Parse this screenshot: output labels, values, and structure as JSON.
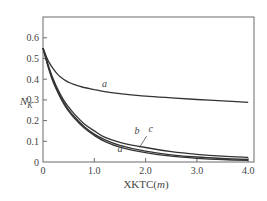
{
  "chart_data": {
    "type": "line",
    "title": "",
    "xlabel": "XKTC(m)",
    "xlabel_prefix": "XKTC(",
    "xlabel_unit": "m",
    "xlabel_suffix": ")",
    "ylabel": "N_K",
    "ylabel_main": "N",
    "ylabel_sub": "K",
    "xlim": [
      0,
      4.0
    ],
    "ylim": [
      0,
      0.7
    ],
    "x_ticks": [
      0,
      1.0,
      2.0,
      3.0,
      4.0
    ],
    "x_tick_labels": [
      "0",
      "1.0",
      "2.0",
      "3.0",
      "4.0"
    ],
    "y_ticks": [
      0,
      0.1,
      0.2,
      0.3,
      0.4,
      0.5,
      0.6
    ],
    "y_tick_labels": [
      "0",
      "0.1",
      "0.2",
      "0.3",
      "0.4",
      "0.5",
      "0.6"
    ],
    "grid": false,
    "legend": "inline curve labels",
    "x": [
      0,
      0.1,
      0.2,
      0.3,
      0.4,
      0.5,
      0.6,
      0.8,
      1.0,
      1.2,
      1.5,
      2.0,
      2.5,
      3.0,
      3.5,
      4.0
    ],
    "series": [
      {
        "name": "a",
        "values": [
          0.55,
          0.49,
          0.45,
          0.42,
          0.4,
          0.385,
          0.375,
          0.36,
          0.35,
          0.34,
          0.33,
          0.318,
          0.31,
          0.302,
          0.295,
          0.288
        ]
      },
      {
        "name": "b",
        "values": [
          0.55,
          0.47,
          0.4,
          0.345,
          0.3,
          0.265,
          0.235,
          0.185,
          0.15,
          0.12,
          0.095,
          0.07,
          0.05,
          0.037,
          0.028,
          0.022
        ]
      },
      {
        "name": "c",
        "values": [
          0.55,
          0.465,
          0.39,
          0.335,
          0.29,
          0.252,
          0.222,
          0.172,
          0.135,
          0.108,
          0.08,
          0.052,
          0.035,
          0.024,
          0.017,
          0.012
        ]
      },
      {
        "name": "d",
        "values": [
          0.55,
          0.46,
          0.385,
          0.33,
          0.283,
          0.245,
          0.215,
          0.165,
          0.128,
          0.1,
          0.072,
          0.045,
          0.028,
          0.018,
          0.012,
          0.008
        ]
      }
    ],
    "annotations": [
      {
        "text": "a",
        "x": 1.2,
        "y": 0.36
      },
      {
        "text": "b",
        "x": 1.83,
        "y": 0.135
      },
      {
        "text": "c",
        "x": 2.1,
        "y": 0.145
      },
      {
        "text": "d",
        "x": 1.5,
        "y": 0.05
      }
    ]
  },
  "colors": {
    "axis": "#6a6a6a",
    "curve": "#333333",
    "text": "#444444",
    "background": "#ffffff"
  }
}
